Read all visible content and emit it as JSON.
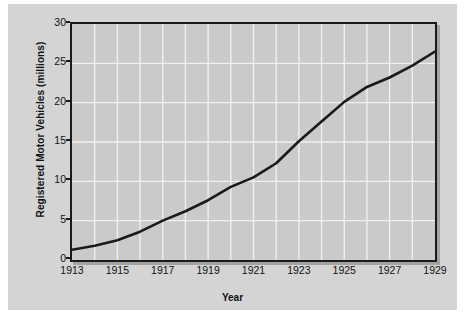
{
  "chart_data": {
    "type": "line",
    "title": "",
    "xlabel": "Year",
    "ylabel": "Registered Motor Vehicles (millions)",
    "xlim": [
      1913,
      1929
    ],
    "ylim": [
      0,
      30
    ],
    "grid": true,
    "legend": "none",
    "x_tick_labels": [
      "1913",
      "1915",
      "1917",
      "1919",
      "1921",
      "1923",
      "1925",
      "1927",
      "1929"
    ],
    "x_tick_values": [
      1913,
      1915,
      1917,
      1919,
      1921,
      1923,
      1925,
      1927,
      1929
    ],
    "y_tick_labels": [
      "0",
      "5",
      "10",
      "15",
      "20",
      "25",
      "30"
    ],
    "y_tick_values": [
      0,
      5,
      10,
      15,
      20,
      25,
      30
    ],
    "x_minor_gridline_values": [
      1914,
      1916,
      1918,
      1920,
      1922,
      1924,
      1926,
      1928
    ],
    "series": [
      {
        "name": "Registered Motor Vehicles",
        "color": "#1a1a1a",
        "x": [
          1913,
          1914,
          1915,
          1916,
          1917,
          1918,
          1919,
          1920,
          1921,
          1922,
          1923,
          1924,
          1925,
          1926,
          1927,
          1928,
          1929
        ],
        "values": [
          1.3,
          1.8,
          2.5,
          3.6,
          5.0,
          6.2,
          7.6,
          9.3,
          10.5,
          12.3,
          15.1,
          17.6,
          20.1,
          22.0,
          23.2,
          24.7,
          26.5
        ]
      }
    ]
  },
  "axis_titles": {
    "y": "Registered Motor Vehicles (millions)",
    "x": "Year"
  },
  "colors": {
    "page_background": "#ffffff",
    "panel_background": "#d4d4d4",
    "plot_background": "#cacaca",
    "gridline": "#f0f0f0",
    "axis": "#1a1a1a",
    "line": "#1a1a1a",
    "text": "#111111"
  }
}
